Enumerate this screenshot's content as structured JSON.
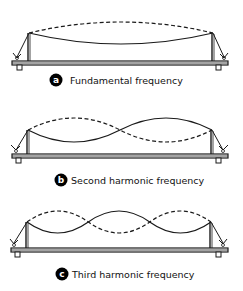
{
  "diagram": {
    "type": "standing-wave-harmonics",
    "panels": [
      {
        "id": "a",
        "badge": "a",
        "label": "Fundamental frequency",
        "loops": 1
      },
      {
        "id": "b",
        "badge": "b",
        "label": "Second harmonic frequency",
        "loops": 2
      },
      {
        "id": "c",
        "badge": "c",
        "label": "Third harmonic frequency",
        "loops": 3
      }
    ],
    "colors": {
      "line": "#1a1a1a",
      "badge_bg": "#000000",
      "badge_fg": "#ffffff",
      "background": "#ffffff"
    }
  }
}
